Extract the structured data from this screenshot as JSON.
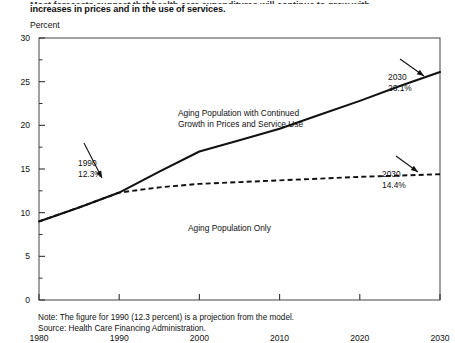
{
  "intro": {
    "cutoff_line": "Most forecasts suggest that health care expenditures will continue to grow with",
    "visible_line": "increases in prices and in the use of services."
  },
  "axis_unit_label": "Percent",
  "footnotes": {
    "note": "Note:  The figure for 1990 (12.3 percent) is a projection from the model.",
    "source": "Source: Health Care Financing Administration."
  },
  "chart_data": {
    "type": "line",
    "title": "",
    "xlabel": "",
    "ylabel": "Percent",
    "xlim": [
      1980,
      2030
    ],
    "ylim": [
      0,
      30
    ],
    "xticks": [
      1980,
      1990,
      2000,
      2010,
      2020,
      2030
    ],
    "yticks": [
      0,
      5,
      10,
      15,
      20,
      25,
      30
    ],
    "yminorticks": [
      2.5,
      7.5,
      12.5,
      17.5,
      22.5,
      27.5
    ],
    "grid": false,
    "legend": "none",
    "x": [
      1980,
      1985,
      1990,
      1995,
      2000,
      2005,
      2010,
      2015,
      2020,
      2025,
      2030
    ],
    "series": [
      {
        "name": "Aging Population with Continued Growth in Prices and Service Use",
        "style": "solid",
        "color": "#111111",
        "values": [
          9.0,
          10.6,
          12.3,
          14.7,
          17.0,
          18.3,
          19.6,
          21.2,
          22.8,
          24.5,
          26.1
        ]
      },
      {
        "name": "Aging Population Only",
        "style": "dashed",
        "color": "#111111",
        "values": [
          9.0,
          10.6,
          12.3,
          12.9,
          13.3,
          13.5,
          13.7,
          13.9,
          14.1,
          14.25,
          14.4
        ]
      }
    ],
    "annotations": [
      {
        "id": "label-upper",
        "text_line1": "Aging Population with Continued",
        "text_line2": "Growth in Prices and Service Use"
      },
      {
        "id": "label-lower",
        "text_line1": "Aging Population Only",
        "text_line2": ""
      },
      {
        "id": "point-1990",
        "text_line1": "1990",
        "text_line2": "12.3%",
        "year": 1990,
        "value": 12.3
      },
      {
        "id": "point-2030-upper",
        "text_line1": "2030",
        "text_line2": "26.1%",
        "year": 2030,
        "value": 26.1
      },
      {
        "id": "point-2030-lower",
        "text_line1": "2030",
        "text_line2": "14.4%",
        "year": 2030,
        "value": 14.4
      }
    ]
  },
  "ytick_labels": [
    "30",
    "25",
    "20",
    "15",
    "10",
    "5",
    "0"
  ],
  "xtick_labels": [
    "1980",
    "1990",
    "2000",
    "2010",
    "2020",
    "2030"
  ]
}
